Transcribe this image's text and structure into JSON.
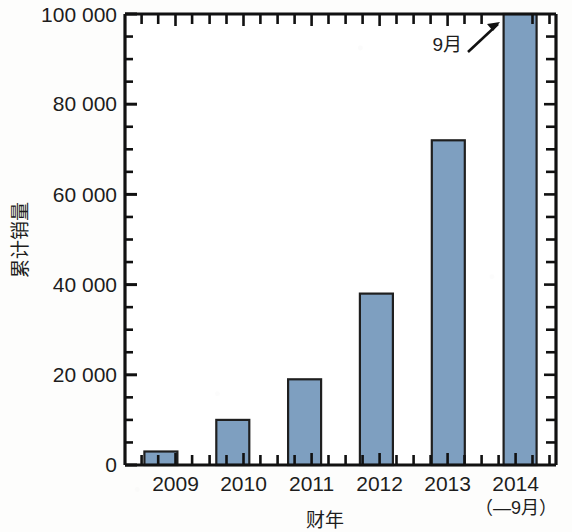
{
  "chart_data": {
    "type": "bar",
    "title": "",
    "subtitle": "",
    "xlabel": "财年",
    "ylabel": "累计销量",
    "categories": [
      "2009",
      "2010",
      "2011",
      "2012",
      "2013",
      "2014"
    ],
    "values": [
      3000,
      10000,
      19000,
      38000,
      72000,
      100000
    ],
    "ylim": [
      0,
      100000
    ],
    "ytick_labels": [
      "0",
      "20 000",
      "40 000",
      "60 000",
      "80 000",
      "100 000"
    ],
    "ytick_values": [
      0,
      20000,
      40000,
      60000,
      80000,
      100000
    ],
    "yminor_step": 5000,
    "grid": false,
    "legend": null,
    "legend_position": "none",
    "bar_fill_color": "#7e9fc0",
    "bar_edge_color": "#1f1f1f",
    "axis_color": "#111111",
    "background_color": "#fdfdfc",
    "annotations": [
      {
        "text": "9月",
        "target_category": "2014",
        "description": "arrow pointing to the 2014 bar"
      }
    ],
    "x_sub_label": "（—9月）",
    "x_sub_label_category": "2014"
  },
  "axes": {
    "y_title": "累计销量",
    "x_title": "财年"
  }
}
